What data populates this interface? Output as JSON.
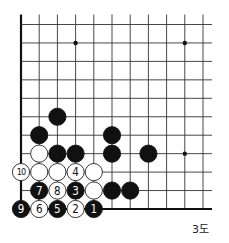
{
  "diagram": {
    "type": "go-board-corner",
    "caption": "3도",
    "grid": {
      "columns": 11,
      "rows": 11,
      "origin_x": 21,
      "origin_y": 24.5,
      "spacing_x": 18.2,
      "spacing_y": 18.45,
      "left_edge": true,
      "bottom_edge": true,
      "line_extend_top": 10,
      "line_extend_right": 9
    },
    "star_points": [
      {
        "col": 3,
        "row": 1
      },
      {
        "col": 9,
        "row": 1
      },
      {
        "col": 9,
        "row": 7
      }
    ],
    "stones": [
      {
        "col": 2,
        "row": 5,
        "color": "black",
        "label": ""
      },
      {
        "col": 1,
        "row": 6,
        "color": "black",
        "label": ""
      },
      {
        "col": 5,
        "row": 6,
        "color": "black",
        "label": ""
      },
      {
        "col": 1,
        "row": 7,
        "color": "white",
        "label": ""
      },
      {
        "col": 2,
        "row": 7,
        "color": "black",
        "label": ""
      },
      {
        "col": 3,
        "row": 7,
        "color": "black",
        "label": ""
      },
      {
        "col": 5,
        "row": 7,
        "color": "black",
        "label": ""
      },
      {
        "col": 7,
        "row": 7,
        "color": "black",
        "label": ""
      },
      {
        "col": 0,
        "row": 8,
        "color": "white",
        "label": "10"
      },
      {
        "col": 1,
        "row": 8,
        "color": "white",
        "label": ""
      },
      {
        "col": 2,
        "row": 8,
        "color": "white",
        "label": ""
      },
      {
        "col": 3,
        "row": 8,
        "color": "white",
        "label": "4"
      },
      {
        "col": 4,
        "row": 8,
        "color": "white",
        "label": ""
      },
      {
        "col": 1,
        "row": 9,
        "color": "black",
        "label": "7"
      },
      {
        "col": 2,
        "row": 9,
        "color": "white",
        "label": "8"
      },
      {
        "col": 3,
        "row": 9,
        "color": "black",
        "label": "3"
      },
      {
        "col": 4,
        "row": 9,
        "color": "white",
        "label": ""
      },
      {
        "col": 5,
        "row": 9,
        "color": "black",
        "label": ""
      },
      {
        "col": 6,
        "row": 9,
        "color": "black",
        "label": ""
      },
      {
        "col": 0,
        "row": 10,
        "color": "black",
        "label": "9"
      },
      {
        "col": 1,
        "row": 10,
        "color": "white",
        "label": "6"
      },
      {
        "col": 2,
        "row": 10,
        "color": "black",
        "label": "5"
      },
      {
        "col": 3,
        "row": 10,
        "color": "white",
        "label": "2"
      },
      {
        "col": 4,
        "row": 10,
        "color": "black",
        "label": "1"
      }
    ],
    "colors": {
      "line": "#333333",
      "edge": "#111111",
      "black_stone": "#111111",
      "white_stone": "#ffffff",
      "white_outline": "#222222"
    }
  }
}
